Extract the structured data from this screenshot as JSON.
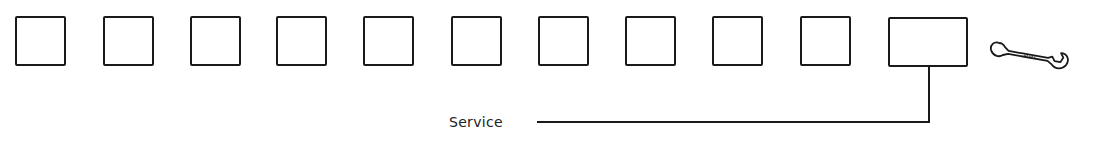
{
  "diagram": {
    "slots": [
      {
        "id": 1,
        "type": "empty"
      },
      {
        "id": 2,
        "type": "empty"
      },
      {
        "id": 3,
        "type": "empty"
      },
      {
        "id": 4,
        "type": "empty"
      },
      {
        "id": 5,
        "type": "empty"
      },
      {
        "id": 6,
        "type": "empty"
      },
      {
        "id": 7,
        "type": "empty"
      },
      {
        "id": 8,
        "type": "empty"
      },
      {
        "id": 9,
        "type": "empty"
      },
      {
        "id": 10,
        "type": "empty"
      },
      {
        "id": 11,
        "type": "service"
      }
    ],
    "icon": "wrench-icon",
    "callout_label": "Service",
    "line_color": "#1a1a1a"
  }
}
